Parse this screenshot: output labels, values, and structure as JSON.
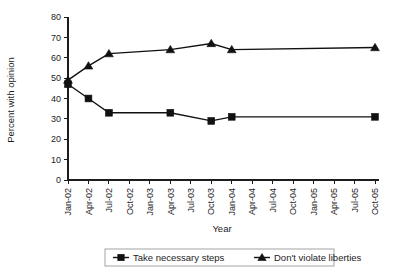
{
  "chart_data": {
    "type": "line",
    "title": "",
    "xlabel": "Year",
    "ylabel": "Percent with opinion",
    "ylim": [
      0,
      80
    ],
    "ytick_step": 10,
    "yticks": [
      "0",
      "10",
      "20",
      "30",
      "40",
      "50",
      "60",
      "70",
      "80"
    ],
    "grid": false,
    "legend_position": "bottom",
    "categories": [
      "Jan-02",
      "Apr-02",
      "Jul-02",
      "Oct-02",
      "Jan-03",
      "Apr-03",
      "Jul-03",
      "Oct-03",
      "Jan-04",
      "Apr-04",
      "Jul-04",
      "Oct-04",
      "Jan-05",
      "Apr-05",
      "Jul-05",
      "Oct-05"
    ],
    "series": [
      {
        "name": "Take necessary steps",
        "marker": "square",
        "color": "#111111",
        "points": [
          {
            "x": "Jan-02",
            "y": 47
          },
          {
            "x": "Apr-02",
            "y": 40
          },
          {
            "x": "Jul-02",
            "y": 33
          },
          {
            "x": "Apr-03",
            "y": 33
          },
          {
            "x": "Oct-03",
            "y": 29
          },
          {
            "x": "Jan-04",
            "y": 31
          },
          {
            "x": "Oct-05",
            "y": 31
          }
        ]
      },
      {
        "name": "Don't violate liberties",
        "marker": "triangle",
        "color": "#111111",
        "points": [
          {
            "x": "Jan-02",
            "y": 49
          },
          {
            "x": "Apr-02",
            "y": 56
          },
          {
            "x": "Jul-02",
            "y": 62
          },
          {
            "x": "Apr-03",
            "y": 64
          },
          {
            "x": "Oct-03",
            "y": 67
          },
          {
            "x": "Jan-04",
            "y": 64
          },
          {
            "x": "Oct-05",
            "y": 65
          }
        ]
      }
    ]
  },
  "legend": {
    "items": [
      {
        "label": "Take necessary steps",
        "marker": "square"
      },
      {
        "label": "Don't violate liberties",
        "marker": "triangle"
      }
    ]
  }
}
